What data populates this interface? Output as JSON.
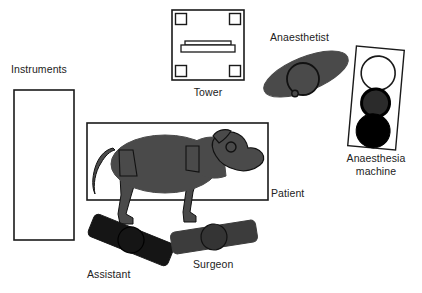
{
  "diagram": {
    "background_color": "#ffffff",
    "width": 422,
    "height": 293,
    "palette": {
      "outline": "#1a1a1a",
      "body_gray": "#4a4a4a",
      "assistant_black": "#151515",
      "surgeon_gray": "#3c3c3c",
      "machine_dial_dark": "#2b2b2b",
      "machine_dial_black": "#000000",
      "machine_dial_white": "#ffffff",
      "label_text": "#222222"
    }
  },
  "labels": {
    "instruments": "Instruments",
    "tower": "Tower",
    "anaesthetist": "Anaesthetist",
    "anaesthesia_machine_line1": "Anaesthesia",
    "anaesthesia_machine_line2": "machine",
    "patient": "Patient",
    "assistant": "Assistant",
    "surgeon": "Surgeon"
  },
  "elements": [
    {
      "name": "instruments-table",
      "label": "Instruments",
      "shape": "rectangle",
      "fill": "#ffffff",
      "stroke": "#1a1a1a",
      "x": 14,
      "y": 90,
      "width": 60,
      "height": 150
    },
    {
      "name": "tower",
      "label": "Tower",
      "shape": "square-with-corner-feet-and-monitor",
      "fill": "#ffffff",
      "stroke": "#1a1a1a",
      "x": 172,
      "y": 10,
      "width": 72,
      "height": 70
    },
    {
      "name": "anaesthetist",
      "label": "Anaesthetist",
      "shape": "rotated-ellipse-with-head-circle",
      "fill": "#4a4a4a",
      "stroke": "#111111",
      "cx": 306,
      "cy": 74,
      "rx": 45,
      "ry": 17,
      "rotation": -22,
      "head_cx": 303,
      "head_cy": 79,
      "head_r": 16
    },
    {
      "name": "anaesthesia-machine",
      "label": "Anaesthesia machine",
      "shape": "tilted-rectangle-with-three-dials",
      "fill": "#ffffff",
      "stroke": "#1a1a1a",
      "x": 352,
      "y": 48,
      "width": 48,
      "height": 100,
      "rotation": 5,
      "dials": [
        {
          "name": "dial-top",
          "fill": "#ffffff",
          "stroke": "#1a1a1a",
          "r": 17
        },
        {
          "name": "dial-middle",
          "fill": "#2b2b2b",
          "stroke": "#000000",
          "r": 14
        },
        {
          "name": "dial-bottom",
          "fill": "#000000",
          "stroke": "#000000",
          "r": 17
        }
      ]
    },
    {
      "name": "patient-table",
      "label": "Patient",
      "shape": "rectangle-with-pig-silhouette",
      "fill": "#ffffff",
      "stroke": "#1a1a1a",
      "x": 87,
      "y": 123,
      "width": 181,
      "height": 77,
      "animal": "pig",
      "animal_fill": "#4a4a4a",
      "animal_stroke": "#111111"
    },
    {
      "name": "assistant",
      "label": "Assistant",
      "shape": "rotated-bar-with-head-circle",
      "fill": "#151515",
      "stroke": "#151515",
      "cx": 131,
      "cy": 240,
      "width": 86,
      "height": 24,
      "rotation": 22,
      "head_r": 13
    },
    {
      "name": "surgeon",
      "label": "Surgeon",
      "shape": "rotated-bar-with-head-circle",
      "fill": "#3c3c3c",
      "stroke": "#3c3c3c",
      "cx": 214,
      "cy": 237,
      "width": 86,
      "height": 22,
      "rotation": -9,
      "head_r": 13
    }
  ]
}
